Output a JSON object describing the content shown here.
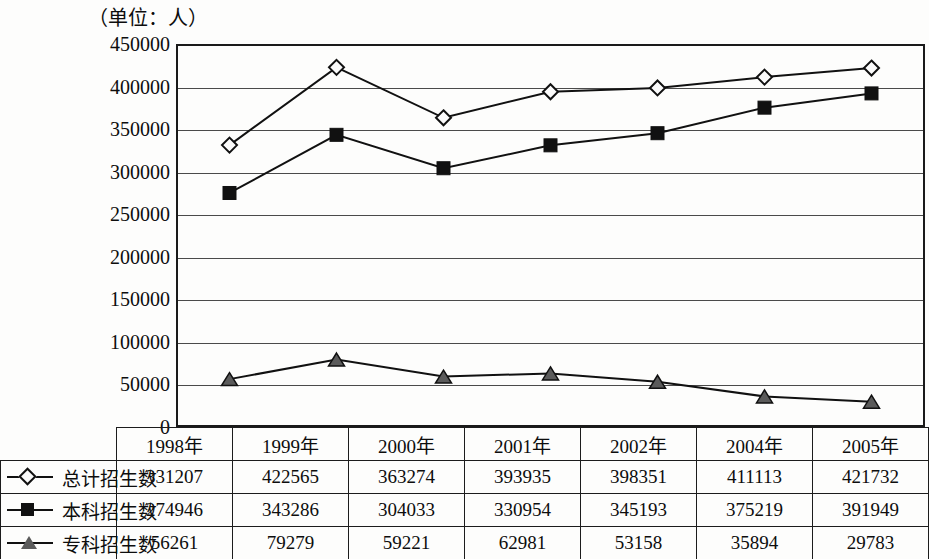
{
  "chart_title": "（单位：人）",
  "chart_data": {
    "type": "line",
    "title": "（单位：人）",
    "xlabel": "",
    "ylabel": "（单位：人）",
    "ylim": [
      0,
      450000
    ],
    "ytick_step": 50000,
    "grid": true,
    "legend_position": "table-left-column",
    "categories": [
      "1998年",
      "1999年",
      "2000年",
      "2001年",
      "2002年",
      "2004年",
      "2005年"
    ],
    "yticks": [
      "0",
      "50000",
      "100000",
      "150000",
      "200000",
      "250000",
      "300000",
      "350000",
      "400000",
      "450000"
    ],
    "series": [
      {
        "name": "总计招生数",
        "marker": "diamond-hollow",
        "values": [
          331207,
          422565,
          363274,
          393935,
          398351,
          411113,
          421732
        ]
      },
      {
        "name": "本科招生数",
        "marker": "square-filled",
        "values": [
          274946,
          343286,
          304033,
          330954,
          345193,
          375219,
          391949
        ]
      },
      {
        "name": "专科招生数",
        "marker": "triangle-filled",
        "values": [
          56261,
          79279,
          59221,
          62981,
          53158,
          35894,
          29783
        ]
      }
    ]
  },
  "colors": {
    "line": "#111111",
    "grid": "#4a4a4a",
    "axis": "#1a1a1a",
    "triangle_fill": "#5b5b5b",
    "background": "#fdfdfc"
  }
}
